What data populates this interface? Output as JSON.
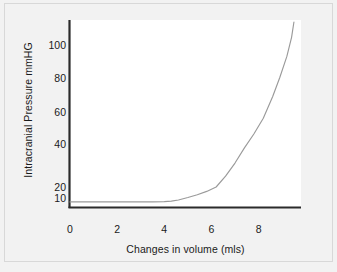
{
  "chart_data": {
    "type": "line",
    "title": "",
    "xlabel": "Changes in volume (mls)",
    "ylabel": "Intracranial Pressure mmHG",
    "xlim": [
      0,
      9.8
    ],
    "ylim": [
      0,
      112
    ],
    "grid": false,
    "legend": null,
    "xticks": [
      {
        "label": "0",
        "value": 0
      },
      {
        "label": "2",
        "value": 2
      },
      {
        "label": "4",
        "value": 4
      },
      {
        "label": "6",
        "value": 6
      },
      {
        "label": "8",
        "value": 8
      }
    ],
    "yticks": [
      {
        "label": "10",
        "value": 10
      },
      {
        "label": "20",
        "value": 20
      },
      {
        "label": "40",
        "value": 40
      },
      {
        "label": "60",
        "value": 60
      },
      {
        "label": "80",
        "value": 80
      },
      {
        "label": "100",
        "value": 100
      }
    ],
    "series": [
      {
        "name": "Intracranial compliance curve",
        "color": "#9a9a9a",
        "x": [
          0.0,
          0.5,
          1.0,
          1.5,
          2.0,
          2.5,
          3.0,
          3.5,
          4.0,
          4.3,
          4.6,
          5.0,
          5.4,
          5.8,
          6.2,
          6.6,
          7.0,
          7.4,
          7.8,
          8.2,
          8.6,
          8.9,
          9.2,
          9.4,
          9.5
        ],
        "y": [
          7,
          7,
          7,
          7,
          7,
          7,
          7,
          7,
          7.2,
          7.6,
          8.5,
          10.5,
          13,
          16,
          20,
          25,
          31,
          38,
          46,
          56,
          69,
          80,
          93,
          104,
          112
        ]
      }
    ]
  },
  "axis": {
    "line_color": "#2b2b2b"
  }
}
